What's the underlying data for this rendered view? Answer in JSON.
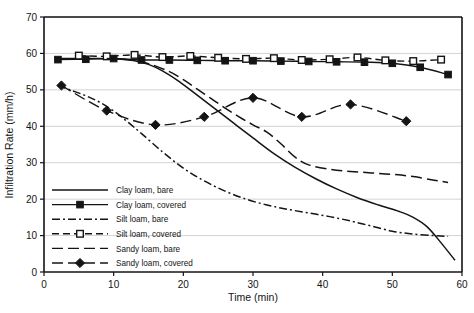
{
  "chart_data": {
    "type": "line",
    "title": "",
    "xlabel": "Time (min)",
    "ylabel": "Infiltration Rate (mm/h)",
    "xlim": [
      0,
      60
    ],
    "ylim": [
      0,
      70
    ],
    "xticks": [
      0,
      10,
      20,
      30,
      40,
      50,
      60
    ],
    "yticks": [
      0,
      10,
      20,
      30,
      40,
      50,
      60,
      70
    ],
    "grid": "horizontal",
    "legend_position": "lower-left-inside",
    "series": [
      {
        "name": "Clay loam, bare",
        "style": "solid",
        "marker": "none",
        "color": "#141414",
        "x": [
          2,
          5,
          8,
          11,
          13,
          15,
          17,
          19,
          21,
          24,
          27,
          30,
          33,
          36,
          39,
          42,
          45,
          48,
          51,
          53,
          55,
          57,
          59
        ],
        "y": [
          58.6,
          58.6,
          58.6,
          58.4,
          58.0,
          57.0,
          55.2,
          52.8,
          50.0,
          45.6,
          41.2,
          36.8,
          32.5,
          28.8,
          25.6,
          22.8,
          20.4,
          18.4,
          16.6,
          15.0,
          12.4,
          8.0,
          3.2
        ]
      },
      {
        "name": "Clay loam, covered",
        "style": "solid",
        "marker": "filled-square",
        "color": "#141414",
        "x": [
          2,
          6,
          10,
          14,
          18,
          22,
          26,
          30,
          34,
          38,
          42,
          46,
          50,
          54,
          58
        ],
        "y": [
          58.3,
          58.4,
          58.6,
          58.2,
          58.2,
          58.1,
          58.0,
          58.0,
          57.9,
          57.8,
          57.7,
          57.6,
          57.3,
          56.2,
          54.2
        ]
      },
      {
        "name": "Silt loam, bare",
        "style": "dash-dot",
        "marker": "none",
        "color": "#141414",
        "x": [
          2,
          4,
          6,
          8,
          10,
          12,
          14,
          17,
          20,
          23,
          26,
          29,
          32,
          35,
          38,
          41,
          44,
          47,
          50,
          53,
          56,
          58
        ],
        "y": [
          51.2,
          49.8,
          48.4,
          46.6,
          44.2,
          41.2,
          38.0,
          33.0,
          28.5,
          25.0,
          22.2,
          20.0,
          18.4,
          17.2,
          16.2,
          15.2,
          14.0,
          12.6,
          11.2,
          10.4,
          10.0,
          9.8
        ]
      },
      {
        "name": "Silt loam, covered",
        "style": "dashed",
        "marker": "open-square",
        "color": "#141414",
        "x": [
          5,
          9,
          13,
          17,
          21,
          25,
          29,
          33,
          37,
          41,
          45,
          49,
          53,
          57
        ],
        "y": [
          59.4,
          59.2,
          59.6,
          59.0,
          59.3,
          58.8,
          58.5,
          58.7,
          58.2,
          58.4,
          58.9,
          58.1,
          57.9,
          58.3
        ]
      },
      {
        "name": "Sandy loam, bare",
        "style": "long-dash",
        "marker": "none",
        "color": "#141414",
        "x": [
          9,
          12,
          15,
          18,
          20,
          22,
          24,
          26,
          28,
          30,
          32,
          34,
          36,
          38,
          41,
          44,
          47,
          50,
          53,
          56,
          58
        ],
        "y": [
          58.6,
          58.3,
          57.2,
          55.0,
          52.8,
          50.2,
          47.6,
          45.0,
          42.6,
          40.4,
          38.4,
          35.2,
          31.6,
          29.4,
          28.2,
          27.6,
          27.2,
          26.8,
          26.2,
          25.2,
          24.6
        ]
      },
      {
        "name": "Sandy loam, covered",
        "style": "long-dash",
        "marker": "filled-diamond",
        "color": "#141414",
        "x": [
          2.5,
          9,
          16,
          23,
          30,
          37,
          44,
          52
        ],
        "y": [
          51.2,
          44.3,
          40.4,
          42.6,
          47.8,
          42.6,
          46.0,
          41.4
        ]
      }
    ]
  },
  "legend": {
    "items": [
      {
        "label": "Clay loam, bare",
        "marker": "none",
        "style": "solid"
      },
      {
        "label": "Clay loam, covered",
        "marker": "filled-square",
        "style": "solid"
      },
      {
        "label": "Silt loam, bare",
        "marker": "none",
        "style": "dash-dot"
      },
      {
        "label": "Silt loam, covered",
        "marker": "open-square",
        "style": "dashed"
      },
      {
        "label": "Sandy loam, bare",
        "marker": "none",
        "style": "long-dash"
      },
      {
        "label": "Sandy loam, covered",
        "marker": "filled-diamond",
        "style": "long-dash"
      }
    ]
  },
  "caption": ""
}
